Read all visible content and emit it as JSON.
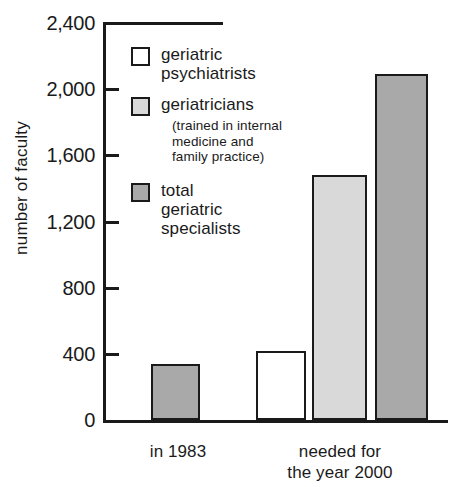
{
  "chart_data": {
    "type": "bar",
    "title": "",
    "xlabel": "",
    "ylabel": "number of faculty",
    "ylim": [
      0,
      2400
    ],
    "yticks": [
      0,
      400,
      800,
      1200,
      1600,
      2000,
      2400
    ],
    "ytick_labels": [
      "0",
      "400",
      "800",
      "1,200",
      "1,600",
      "2,000",
      "2,400"
    ],
    "grid": false,
    "legend_position": "inside-upper-left",
    "categories": [
      "in 1983",
      "needed for the year 2000"
    ],
    "series": [
      {
        "name": "geriatric psychiatrists",
        "color": "#ffffff",
        "values": [
          null,
          420
        ]
      },
      {
        "name": "geriatricians",
        "color": "#d9d9d9",
        "values": [
          null,
          1480
        ]
      },
      {
        "name": "total geriatric specialists",
        "color": "#a9a9a9",
        "values": [
          340,
          2090
        ]
      }
    ],
    "bars": [
      {
        "group": "in 1983",
        "series": "total geriatric specialists",
        "value": 340,
        "color": "#a9a9a9",
        "x": 48,
        "width": 49
      },
      {
        "group": "needed for the year 2000",
        "series": "geriatric psychiatrists",
        "value": 420,
        "color": "#ffffff",
        "x": 153,
        "width": 50
      },
      {
        "group": "needed for the year 2000",
        "series": "geriatricians",
        "value": 1480,
        "color": "#d9d9d9",
        "x": 209,
        "width": 55
      },
      {
        "group": "needed for the year 2000",
        "series": "total geriatric specialists",
        "value": 2090,
        "color": "#a9a9a9",
        "x": 272,
        "width": 53
      }
    ]
  },
  "axis": {
    "y_title": "number of faculty",
    "tick_labels": [
      "2,400",
      "2,000",
      "1,600",
      "1,200",
      "800",
      "400",
      "0"
    ],
    "category_labels": [
      "in 1983",
      "needed for\nthe year 2000"
    ],
    "category_label_0": "in 1983",
    "category_label_1_line1": "needed for",
    "category_label_1_line2": "the year 2000"
  },
  "legend": {
    "items": [
      {
        "label": "geriatric",
        "label_line2": "psychiatrists",
        "swatch_color": "#ffffff",
        "sub": ""
      },
      {
        "label": "geriatricians",
        "label_line2": "",
        "swatch_color": "#d9d9d9",
        "sub_line1": "(trained in internal",
        "sub_line2": "medicine and",
        "sub_line3": "family practice)"
      },
      {
        "label": "total",
        "label_line2": "geriatric",
        "label_line3": "specialists",
        "swatch_color": "#a9a9a9",
        "sub": ""
      }
    ]
  },
  "colors": {
    "ink": "#1a1a1a",
    "white_fill": "#ffffff",
    "light_gray_fill": "#d9d9d9",
    "dark_gray_fill": "#a9a9a9",
    "background": "#ffffff"
  }
}
